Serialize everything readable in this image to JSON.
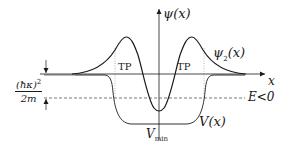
{
  "figure": {
    "colors": {
      "stroke": "#1a1a1a",
      "dashed": "#555555",
      "dotted": "#888888",
      "background": "#ffffff"
    },
    "labels": {
      "y_axis": "ψ(x)",
      "x_axis": "x",
      "wavefunction": "ψ",
      "wavefunction_sub": "2",
      "wavefunction_arg": "(x)",
      "potential": "V(x)",
      "vmin": "V",
      "vmin_sub": "min",
      "energy": "E<0",
      "turning_point_left": "TP",
      "turning_point_right": "TP",
      "depth_num": "(ħκ)",
      "depth_num_sup": "2",
      "depth_den": "2m"
    },
    "elements": {
      "axes": [
        "x-axis with arrow",
        "y-axis with arrow"
      ],
      "curves": [
        "wavefunction psi_2(x) with two positive lobes and central dip",
        "potential well V(x)"
      ],
      "guides": [
        "dashed energy level E<0",
        "dotted turning point lines",
        "arrows marking binding energy depth"
      ]
    }
  }
}
